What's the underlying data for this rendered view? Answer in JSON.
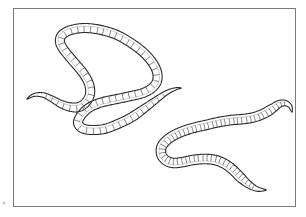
{
  "figure": {
    "caption": "",
    "background_color": "#ffffff",
    "frame": {
      "present": true,
      "color": "#7a7a7a",
      "x": 13,
      "y": 8,
      "width": 283,
      "height": 199
    },
    "artifact_marks": [
      {
        "name": "bottom-left-speck",
        "x": 4,
        "y": 203
      }
    ]
  },
  "chart_data": {
    "type": "line",
    "title": "",
    "subtitle": "",
    "xlabel": "",
    "ylabel": "",
    "grid": false,
    "legend_position": "none",
    "subjects": [
      {
        "name": "upper-worm",
        "label": "Earthworm forming a closed loop",
        "segment_count": 72,
        "body_width_px": 9.0,
        "stroke_color": "#2b2b2b",
        "fill_color": "#ffffff",
        "centerline": [
          [
            27,
            99
          ],
          [
            34,
            95
          ],
          [
            43,
            95
          ],
          [
            52,
            99
          ],
          [
            61,
            104
          ],
          [
            70,
            107
          ],
          [
            79,
            107
          ],
          [
            86,
            102
          ],
          [
            90,
            94
          ],
          [
            89,
            84
          ],
          [
            83,
            73
          ],
          [
            73,
            61
          ],
          [
            64,
            50
          ],
          [
            60,
            42
          ],
          [
            62,
            35
          ],
          [
            71,
            30
          ],
          [
            85,
            28
          ],
          [
            101,
            30
          ],
          [
            117,
            35
          ],
          [
            131,
            43
          ],
          [
            143,
            52
          ],
          [
            152,
            62
          ],
          [
            157,
            72
          ],
          [
            157,
            81
          ],
          [
            152,
            88
          ],
          [
            143,
            93
          ],
          [
            131,
            96
          ],
          [
            117,
            99
          ],
          [
            103,
            102
          ],
          [
            92,
            106
          ],
          [
            85,
            111
          ],
          [
            80,
            117
          ],
          [
            78,
            123
          ],
          [
            82,
            128
          ],
          [
            91,
            130
          ],
          [
            104,
            129
          ],
          [
            118,
            124
          ],
          [
            132,
            117
          ],
          [
            145,
            108
          ],
          [
            156,
            100
          ],
          [
            166,
            93
          ],
          [
            175,
            89
          ],
          [
            181,
            88
          ]
        ],
        "tips": [
          {
            "name": "left-tip",
            "x": 27,
            "y": 99,
            "taper": "pointed"
          },
          {
            "name": "right-tip",
            "x": 181,
            "y": 88,
            "taper": "pointed"
          }
        ]
      },
      {
        "name": "lower-worm",
        "label": "Earthworm in an S / sigmoid curve",
        "segment_count": 64,
        "body_width_px": 9.5,
        "stroke_color": "#2b2b2b",
        "fill_color": "#ffffff",
        "centerline": [
          [
            266,
            190
          ],
          [
            257,
            189
          ],
          [
            248,
            184
          ],
          [
            240,
            177
          ],
          [
            233,
            170
          ],
          [
            225,
            164
          ],
          [
            215,
            160
          ],
          [
            204,
            159
          ],
          [
            193,
            160
          ],
          [
            183,
            162
          ],
          [
            174,
            163
          ],
          [
            167,
            161
          ],
          [
            162,
            156
          ],
          [
            161,
            149
          ],
          [
            164,
            143
          ],
          [
            171,
            137
          ],
          [
            181,
            132
          ],
          [
            193,
            128
          ],
          [
            206,
            125
          ],
          [
            219,
            122
          ],
          [
            232,
            120
          ],
          [
            244,
            119
          ],
          [
            255,
            117
          ],
          [
            265,
            113
          ],
          [
            273,
            108
          ],
          [
            279,
            104
          ],
          [
            285,
            103
          ],
          [
            290,
            106
          ],
          [
            292,
            112
          ]
        ],
        "tips": [
          {
            "name": "lower-left-tip",
            "x": 266,
            "y": 190,
            "taper": "pointed"
          },
          {
            "name": "upper-right-tip",
            "x": 292,
            "y": 112,
            "taper": "pointed"
          }
        ]
      }
    ],
    "overlaps": [
      {
        "name": "loop-crossing",
        "description": "Upper worm's posterior end crosses over the right side of its own loop",
        "x": 152,
        "y": 92
      }
    ]
  }
}
